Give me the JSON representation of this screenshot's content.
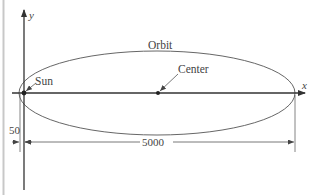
{
  "diagram": {
    "axes": {
      "x_label": "x",
      "y_label": "y"
    },
    "labels": {
      "orbit": "Orbit",
      "sun": "Sun",
      "center": "Center"
    },
    "dimensions": {
      "major_axis_length": "5000",
      "sun_offset": "50"
    },
    "colors": {
      "line": "#333333",
      "orbit": "#555555",
      "border": "#cccccc",
      "text": "#444444"
    }
  }
}
